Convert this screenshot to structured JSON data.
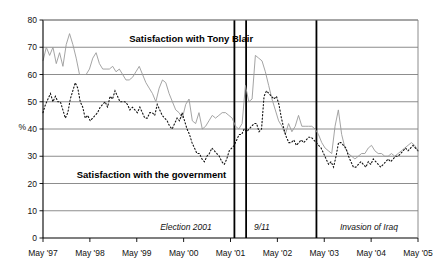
{
  "chart_data": {
    "type": "line",
    "title": "",
    "xlabel": "",
    "ylabel": "%",
    "ylim": [
      0,
      80
    ],
    "ytick_step": 10,
    "yticks": [
      0,
      10,
      20,
      30,
      40,
      50,
      60,
      70,
      80
    ],
    "grid": true,
    "legend_position": "inline-annotations",
    "x_tick_labels": [
      "May '97",
      "May '98",
      "May '99",
      "May '00",
      "May '01",
      "May '02",
      "May '03",
      "May '04",
      "May '05"
    ],
    "x_range_start": "May 1997",
    "x_range_end": "May 2005",
    "x_unit": "month",
    "annotations": [
      {
        "label": "Election 2001",
        "x": "2001-06",
        "style": "italic",
        "vertical_line": true
      },
      {
        "label": "9/11",
        "x": "2001-09",
        "style": "italic",
        "vertical_line": true
      },
      {
        "label": "Invasion of Iraq",
        "x": "2003-03",
        "style": "italic",
        "vertical_line": true
      }
    ],
    "inline_labels": [
      {
        "text": "Satisfaction with Tony Blair",
        "x": 0.23,
        "y": 72
      },
      {
        "text": "Satisfaction with the government",
        "x": 0.09,
        "y": 22
      }
    ],
    "series": [
      {
        "name": "Satisfaction with Tony Blair",
        "style": "solid",
        "color": "#9a9a9a",
        "values": [
          65,
          70,
          67,
          70,
          64,
          68,
          63,
          71,
          75,
          71,
          66,
          60,
          60,
          60,
          62,
          66,
          68,
          64,
          62,
          62,
          62,
          63,
          61,
          62,
          60,
          58,
          58,
          59,
          61,
          63,
          60,
          57,
          55,
          53,
          50,
          55,
          58,
          57,
          53,
          50,
          47,
          46,
          44,
          49,
          51,
          43,
          42,
          46,
          40,
          41,
          43,
          45,
          44,
          45,
          46,
          46,
          45,
          44,
          41,
          40,
          42,
          56,
          50,
          51,
          67,
          66,
          65,
          61,
          56,
          51,
          47,
          43,
          41,
          38,
          42,
          39,
          41,
          45,
          41,
          41,
          41,
          41,
          40,
          38,
          35,
          33,
          32,
          31,
          41,
          47,
          38,
          33,
          31,
          30,
          29,
          30,
          31,
          31,
          33,
          34,
          32,
          31,
          31,
          30,
          30,
          31,
          30,
          31,
          32,
          33,
          34,
          35,
          34,
          32
        ]
      },
      {
        "name": "Satisfaction with the government",
        "style": "dotted",
        "color": "#111111",
        "values": [
          46,
          49,
          51,
          53,
          50,
          52,
          50,
          50,
          47,
          44,
          46,
          51,
          54,
          57,
          55,
          50,
          48,
          44,
          45,
          43,
          44,
          45,
          46,
          48,
          49,
          50,
          48,
          52,
          51,
          54,
          52,
          50,
          50,
          50,
          49,
          47,
          48,
          47,
          46,
          48,
          46,
          44,
          44,
          46,
          46,
          45,
          49,
          47,
          45,
          44,
          43,
          41,
          40,
          42,
          44,
          43,
          46,
          43,
          40,
          38,
          35,
          33,
          31,
          31,
          29,
          28,
          30,
          31,
          33,
          32,
          31,
          30,
          28,
          27,
          29,
          32,
          33,
          34,
          36,
          38,
          38,
          40,
          39,
          40,
          41,
          42,
          42,
          39,
          40,
          52,
          54,
          53,
          52,
          51,
          52,
          49,
          44,
          40,
          37,
          35,
          35,
          36,
          34,
          35,
          36,
          35,
          36,
          37,
          37,
          36,
          35,
          34,
          33,
          31
        ]
      }
    ],
    "series_b_tail": [
      29,
      27,
      28,
      26,
      30,
      35,
      35,
      34,
      33,
      30,
      28,
      26,
      26,
      27,
      28,
      27,
      26,
      28,
      27,
      29,
      28,
      27,
      26,
      27,
      28,
      29,
      28,
      29,
      30,
      30,
      31,
      32,
      33,
      32,
      33,
      34,
      33,
      32
    ]
  },
  "axis": {
    "y_unit_label": "%"
  }
}
